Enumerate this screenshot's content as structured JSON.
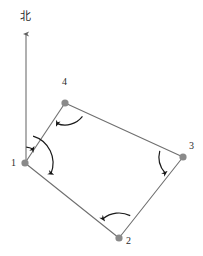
{
  "figure": {
    "type": "survey-traverse-diagram",
    "width": 203,
    "height": 256,
    "background_color": "#ffffff",
    "line_color": "#6f6f6f",
    "arc_color": "#1a1a1a",
    "vertex_color": "#8a8a8a",
    "label_color": "#2b2b2b"
  },
  "north_arrow": {
    "label": "北",
    "label_x": 20,
    "label_y": 11,
    "tip_x": 26,
    "tip_y": 30,
    "tail_x": 26,
    "tail_y": 163
  },
  "vertices": [
    {
      "id": "1",
      "label": "1",
      "x": 25,
      "y": 163,
      "label_x": 11,
      "label_y": 158
    },
    {
      "id": "2",
      "label": "2",
      "x": 119,
      "y": 238,
      "label_x": 126,
      "label_y": 236
    },
    {
      "id": "3",
      "label": "3",
      "x": 183,
      "y": 157,
      "label_x": 189,
      "label_y": 141
    },
    {
      "id": "4",
      "label": "4",
      "x": 65,
      "y": 103,
      "label_x": 62,
      "label_y": 77
    }
  ],
  "edges": [
    {
      "from": "1",
      "to": "4"
    },
    {
      "from": "4",
      "to": "3"
    },
    {
      "from": "3",
      "to": "2"
    },
    {
      "from": "2",
      "to": "1"
    }
  ],
  "angle_arcs": [
    {
      "id": "arc-1-north-to-4",
      "at": "1",
      "from": "north",
      "to": "4",
      "radius": 16
    },
    {
      "id": "arc-1-north-to-2",
      "at": "1",
      "from": "north",
      "to": "2",
      "radius": 28
    },
    {
      "id": "arc-4-3-to-1",
      "at": "4",
      "from": "3",
      "to": "1",
      "radius": 22
    },
    {
      "id": "arc-3-4-to-2",
      "at": "3",
      "from": "4",
      "to": "2",
      "radius": 24
    },
    {
      "id": "arc-2-3-to-1",
      "at": "2",
      "from": "3",
      "to": "1",
      "radius": 25
    }
  ]
}
